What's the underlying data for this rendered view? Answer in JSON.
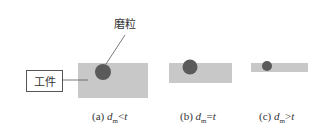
{
  "labels": {
    "workpiece": "工件",
    "abrasive": "磨粒"
  },
  "colors": {
    "workpiece_fill": "#c8c8c8",
    "abrasive_fill": "#5a5a5a",
    "line": "#555555"
  },
  "panels": [
    {
      "id": "a",
      "prefix": "(a) ",
      "var": "d",
      "sub": "m",
      "relation": "<",
      "rhs": "t"
    },
    {
      "id": "b",
      "prefix": "(b) ",
      "var": "d",
      "sub": "m",
      "relation": "=",
      "rhs": "t"
    },
    {
      "id": "c",
      "prefix": "(c) ",
      "var": "d",
      "sub": "m",
      "relation": ">",
      "rhs": "t"
    }
  ]
}
